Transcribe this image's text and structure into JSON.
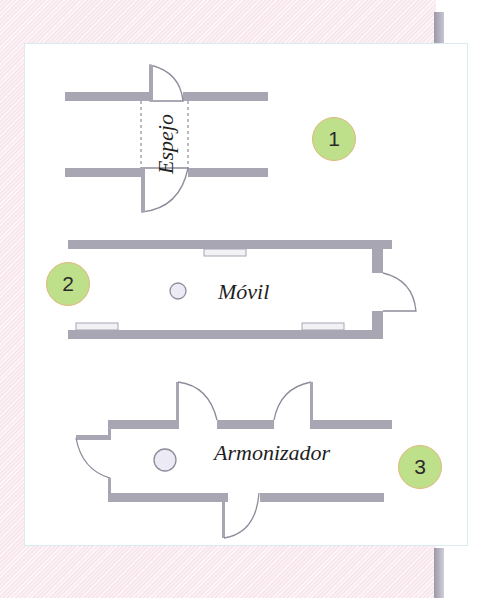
{
  "diagram": {
    "type": "floor-plan-configurations",
    "colors": {
      "wall": "#a9a6b3",
      "outline": "#8f8c9a",
      "badge_fill": "#bfe08a",
      "badge_border": "#e0b77f",
      "background": "#fbeef2",
      "card": "#ffffff"
    },
    "configurations": [
      {
        "number": "1",
        "label": "Espejo",
        "description": "two parallel walls with a half-round mirror panel between dashed lines"
      },
      {
        "number": "2",
        "label": "Móvil",
        "description": "long corridor with a single swinging door at the right end and three wall windows"
      },
      {
        "number": "3",
        "label": "Armonizador",
        "description": "cross-shaped room with four curved doors"
      }
    ]
  }
}
